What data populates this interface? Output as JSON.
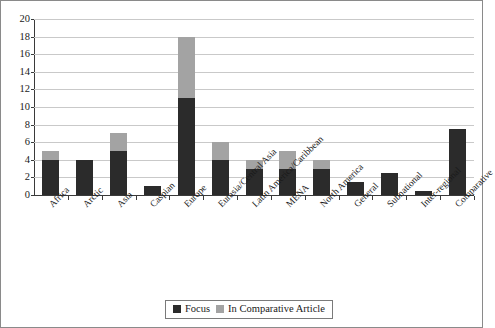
{
  "chart_data": {
    "type": "bar",
    "subtype": "stacked-vertical",
    "title": "",
    "xlabel": "",
    "ylabel": "",
    "ylim": [
      0,
      20
    ],
    "ytick_step": 2,
    "yticks": [
      0,
      2,
      4,
      6,
      8,
      10,
      12,
      14,
      16,
      18,
      20
    ],
    "grid": true,
    "grid_axis": "y",
    "legend_position": "bottom-center",
    "categories": [
      "Africa",
      "Arctic",
      "Asia",
      "Caspian",
      "Europe",
      "Eurasia/Central Asia",
      "Latin America/Caribbean",
      "MENA",
      "North America",
      "General",
      "Subnational",
      "Inter-regional",
      "Comparative"
    ],
    "series": [
      {
        "name": "Focus",
        "color": "#2b2b2b",
        "values": [
          4,
          4,
          5,
          1,
          11,
          4,
          3,
          3,
          3,
          1.5,
          2.5,
          0.5,
          7.5
        ]
      },
      {
        "name": "In Comparative Article",
        "color": "#a3a3a3",
        "values": [
          1,
          0,
          2,
          0,
          7,
          2,
          1,
          2,
          1,
          0,
          0,
          0,
          0
        ]
      }
    ],
    "totals": [
      5,
      4,
      7,
      1,
      18,
      6,
      4,
      5,
      4,
      1.5,
      2.5,
      0.5,
      7.5
    ]
  },
  "legend": {
    "entries": [
      {
        "label": "Focus",
        "color": "#2b2b2b"
      },
      {
        "label": "In Comparative Article",
        "color": "#a3a3a3"
      }
    ]
  },
  "colors": {
    "focus": "#2b2b2b",
    "comparative": "#a3a3a3",
    "gridline": "#c9c9c9",
    "axis": "#3a3a3a",
    "frame": "#8a8a8a",
    "background": "#ffffff"
  }
}
